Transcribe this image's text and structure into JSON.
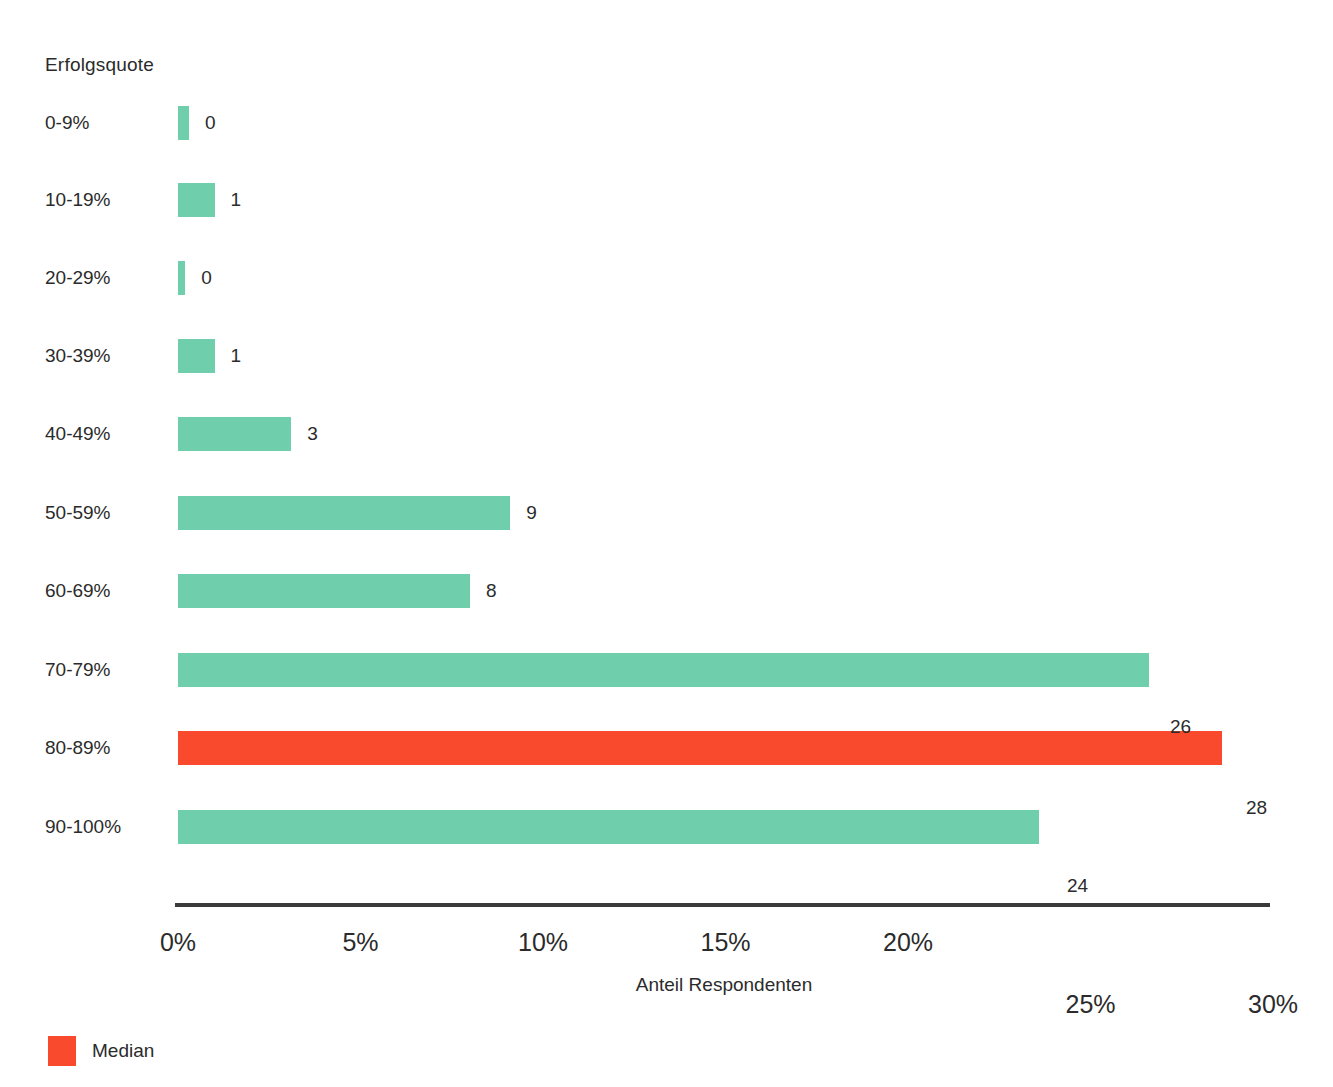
{
  "chart_data": {
    "type": "bar",
    "orientation": "horizontal",
    "title": "",
    "series_title": "Erfolgsquote",
    "xlabel": "Anteil Respondenten",
    "ylabel": "Erfolgsquote",
    "categories": [
      "0-9%",
      "10-19%",
      "20-29%",
      "30-39%",
      "40-49%",
      "50-59%",
      "60-69%",
      "70-79%",
      "80-89%",
      "90-100%"
    ],
    "values": [
      0.3,
      1.0,
      0.2,
      1.0,
      3.1,
      9.1,
      8.0,
      26.6,
      28.6,
      23.6
    ],
    "data_labels": [
      "0",
      "1",
      "0",
      "1",
      "3",
      "9",
      "8",
      "26",
      "28",
      "24"
    ],
    "bar_colors": [
      "#6FCEAC",
      "#6FCEAC",
      "#6FCEAC",
      "#6FCEAC",
      "#6FCEAC",
      "#6FCEAC",
      "#6FCEAC",
      "#6FCEAC",
      "#F94A2D",
      "#6FCEAC"
    ],
    "xlim": [
      0,
      30
    ],
    "xticks": [
      0,
      5,
      10,
      15,
      20,
      25,
      30
    ],
    "xticklabels": [
      "0%",
      "5%",
      "10%",
      "15%",
      "20%",
      "25%",
      "30%"
    ],
    "grid": false,
    "legend": {
      "position": "bottom-left",
      "entries": [
        {
          "label": "Median",
          "color": "#F94A2D"
        }
      ]
    },
    "colors": {
      "bar": "#6FCEAC",
      "median": "#F94A2D",
      "axis": "#3a3a3a",
      "text": "#2b2b2b",
      "background": "#ffffff"
    }
  },
  "layout": {
    "plot_left_px": 178,
    "axis_right_px": 1270,
    "px_per_percent": 36.5,
    "row_tops_px": [
      123,
      200,
      278,
      356,
      434,
      513,
      591,
      670,
      748,
      827
    ],
    "tick_label_tops_px": [
      928,
      928,
      928,
      928,
      928,
      990,
      990
    ],
    "label_offsets": {
      "26": {
        "x": 1170,
        "y": 727
      },
      "28": {
        "x": 1246,
        "y": 808
      },
      "24": {
        "x": 1067,
        "y": 886
      }
    },
    "axis_title_pos": {
      "x": 724,
      "y": 974
    }
  }
}
